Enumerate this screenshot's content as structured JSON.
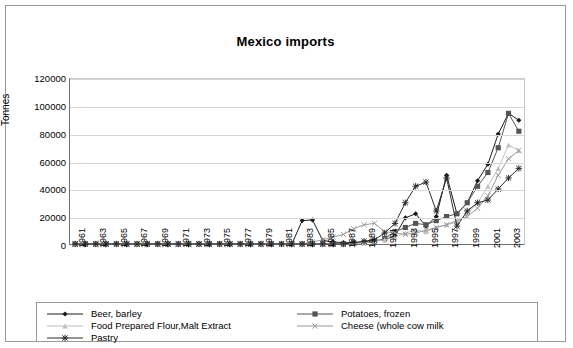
{
  "chart_data": {
    "type": "line",
    "title": "Mexico imports",
    "xlabel": "",
    "ylabel": "Tonnes",
    "ylim": [
      0,
      120000
    ],
    "ytick_values": [
      0,
      20000,
      40000,
      60000,
      80000,
      100000,
      120000
    ],
    "ytick_labels": [
      "0",
      "20000",
      "40000",
      "60000",
      "80000",
      "100000",
      "120000"
    ],
    "grid": true,
    "legend_position": "bottom",
    "x": [
      1961,
      1962,
      1963,
      1964,
      1965,
      1966,
      1967,
      1968,
      1969,
      1970,
      1971,
      1972,
      1973,
      1974,
      1975,
      1976,
      1977,
      1978,
      1979,
      1980,
      1981,
      1982,
      1983,
      1984,
      1985,
      1986,
      1987,
      1988,
      1989,
      1990,
      1991,
      1992,
      1993,
      1994,
      1995,
      1996,
      1997,
      1998,
      1999,
      2000,
      2001,
      2002,
      2003,
      2004
    ],
    "xtick_labels": [
      "1961",
      "1963",
      "1965",
      "1967",
      "1969",
      "1971",
      "1973",
      "1975",
      "1977",
      "1979",
      "1981",
      "1983",
      "1985",
      "1987",
      "1989",
      "1991",
      "1993",
      "1995",
      "1997",
      "1999",
      "2001",
      "2003"
    ],
    "series": [
      {
        "name": "Beer, barley",
        "marker": "diamond",
        "color": "#1a1a1a",
        "values": [
          0,
          0,
          0,
          0,
          0,
          0,
          0,
          0,
          0,
          0,
          0,
          0,
          0,
          0,
          0,
          0,
          0,
          0,
          0,
          0,
          0,
          0,
          17000,
          17500,
          2500,
          1500,
          1000,
          1000,
          1500,
          2500,
          3000,
          6000,
          19000,
          22000,
          13000,
          20000,
          50000,
          22000,
          30000,
          46000,
          58000,
          80000,
          95000,
          90000
        ]
      },
      {
        "name": "Potatoes, frozen",
        "marker": "square",
        "color": "#555555",
        "values": [
          0,
          0,
          0,
          0,
          0,
          0,
          0,
          0,
          0,
          0,
          0,
          0,
          0,
          0,
          0,
          0,
          0,
          0,
          0,
          0,
          0,
          0,
          0,
          0,
          0,
          0,
          0,
          500,
          1000,
          1500,
          4000,
          9000,
          12000,
          15000,
          14000,
          17000,
          20000,
          22000,
          30000,
          42000,
          52000,
          70000,
          95000,
          82000
        ]
      },
      {
        "name": "Food Prepared Flour,Malt Extract",
        "marker": "triangle",
        "color": "#c0c0c0",
        "values": [
          0,
          0,
          0,
          0,
          0,
          0,
          0,
          0,
          0,
          0,
          0,
          0,
          0,
          0,
          0,
          0,
          0,
          0,
          0,
          0,
          0,
          0,
          0,
          0,
          0,
          0,
          0,
          500,
          1000,
          2000,
          3000,
          5000,
          8000,
          10000,
          9000,
          12000,
          14000,
          16000,
          22000,
          30000,
          42000,
          55000,
          72000,
          68000
        ]
      },
      {
        "name": "Cheese (whole cow milk",
        "marker": "cross",
        "color": "#9a9a9a",
        "values": [
          0,
          0,
          0,
          0,
          0,
          0,
          0,
          0,
          0,
          0,
          0,
          0,
          0,
          0,
          0,
          0,
          0,
          0,
          0,
          0,
          0,
          0,
          0,
          1500,
          3000,
          5000,
          7000,
          11000,
          14000,
          15000,
          9000,
          8000,
          7000,
          8000,
          10000,
          12000,
          14000,
          17000,
          20000,
          26000,
          35000,
          50000,
          62000,
          68000
        ]
      },
      {
        "name": "Pastry",
        "marker": "star",
        "color": "#2b2b2b",
        "values": [
          0,
          0,
          0,
          0,
          0,
          0,
          0,
          0,
          0,
          0,
          0,
          0,
          0,
          0,
          0,
          0,
          0,
          0,
          0,
          0,
          0,
          0,
          0,
          0,
          0,
          0,
          0,
          1000,
          2000,
          3000,
          8000,
          15000,
          30000,
          42000,
          45000,
          24000,
          48000,
          13000,
          24000,
          30000,
          32000,
          40000,
          48000,
          55000
        ]
      }
    ]
  },
  "legend": {
    "items": [
      {
        "label": "Beer, barley",
        "marker": "diamond"
      },
      {
        "label": "Potatoes, frozen",
        "marker": "square"
      },
      {
        "label": "Food Prepared Flour,Malt Extract",
        "marker": "triangle"
      },
      {
        "label": "Cheese (whole cow milk",
        "marker": "cross"
      },
      {
        "label": "Pastry",
        "marker": "star"
      }
    ]
  }
}
